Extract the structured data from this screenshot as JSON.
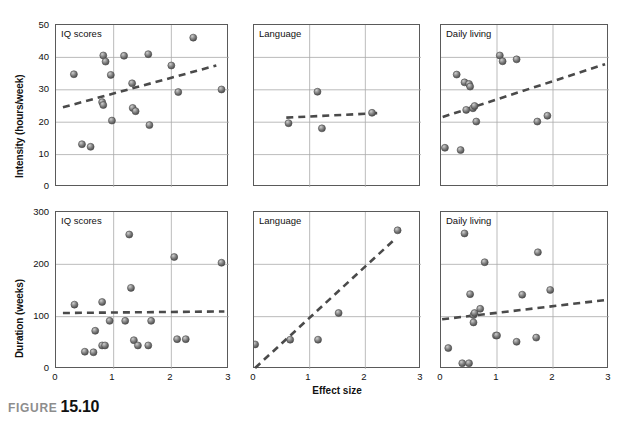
{
  "figure": {
    "caption_word": "FIGURE",
    "caption_number": "15.10"
  },
  "axes": {
    "xlabel": "Effect size",
    "ylabel_top": "Intensity (hours/week)",
    "ylabel_bottom": "Duration (weeks)",
    "xticks": [
      "0",
      "1",
      "2",
      "3"
    ],
    "yticks_top": [
      "0",
      "10",
      "20",
      "30",
      "40",
      "50"
    ],
    "yticks_bottom": [
      "0",
      "100",
      "200",
      "300"
    ]
  },
  "style": {
    "marker_fill": "#7d7d7d",
    "marker_edge": "#4a4a4a",
    "marker_highlight": "#cfcfcf",
    "trend_color": "#4a4a4a",
    "grid_color": "#aaaaaa",
    "frame_color": "#5a5a5a",
    "caption_word_color": "#8d8d8d"
  },
  "panel_titles": {
    "iq": "IQ scores",
    "language": "Language",
    "daily": "Daily living"
  },
  "chart_data": [
    {
      "id": "top-iq",
      "type": "scatter",
      "title": "IQ scores",
      "xlabel": "Effect size",
      "ylabel": "Intensity (hours/week)",
      "xlim": [
        0,
        3
      ],
      "ylim": [
        0,
        50
      ],
      "grid": true,
      "points": [
        {
          "x": 0.31,
          "y": 34.8
        },
        {
          "x": 0.45,
          "y": 13.2
        },
        {
          "x": 0.6,
          "y": 12.4
        },
        {
          "x": 0.82,
          "y": 40.6
        },
        {
          "x": 0.86,
          "y": 38.7
        },
        {
          "x": 0.8,
          "y": 26.2
        },
        {
          "x": 0.82,
          "y": 25.3
        },
        {
          "x": 0.95,
          "y": 34.6
        },
        {
          "x": 0.97,
          "y": 20.5
        },
        {
          "x": 1.18,
          "y": 40.5
        },
        {
          "x": 1.32,
          "y": 32.0
        },
        {
          "x": 1.33,
          "y": 24.4
        },
        {
          "x": 1.38,
          "y": 23.4
        },
        {
          "x": 1.6,
          "y": 41.0
        },
        {
          "x": 1.62,
          "y": 19.1
        },
        {
          "x": 2.0,
          "y": 37.5
        },
        {
          "x": 2.12,
          "y": 29.3
        },
        {
          "x": 2.38,
          "y": 46.1
        },
        {
          "x": 2.87,
          "y": 30.1
        }
      ],
      "trendline": {
        "x0": 0.12,
        "y0": 24.6,
        "x1": 2.78,
        "y1": 37.5
      }
    },
    {
      "id": "top-language",
      "type": "scatter",
      "title": "Language",
      "xlabel": "Effect size",
      "ylabel": "Intensity (hours/week)",
      "xlim": [
        0,
        3
      ],
      "ylim": [
        0,
        50
      ],
      "grid": true,
      "points": [
        {
          "x": 0.62,
          "y": 19.7
        },
        {
          "x": 1.14,
          "y": 29.4
        },
        {
          "x": 1.22,
          "y": 18.1
        },
        {
          "x": 2.12,
          "y": 22.9
        }
      ],
      "trendline": {
        "x0": 0.58,
        "y0": 21.4,
        "x1": 2.22,
        "y1": 22.8
      }
    },
    {
      "id": "top-daily",
      "type": "scatter",
      "title": "Daily living",
      "xlabel": "Effect size",
      "ylabel": "Intensity (hours/week)",
      "xlim": [
        0,
        3
      ],
      "ylim": [
        0,
        50
      ],
      "grid": true,
      "points": [
        {
          "x": 0.07,
          "y": 12.1
        },
        {
          "x": 0.28,
          "y": 34.7
        },
        {
          "x": 0.35,
          "y": 11.4
        },
        {
          "x": 0.42,
          "y": 32.3
        },
        {
          "x": 0.5,
          "y": 31.8
        },
        {
          "x": 0.52,
          "y": 31.0
        },
        {
          "x": 0.45,
          "y": 23.8
        },
        {
          "x": 0.57,
          "y": 24.3
        },
        {
          "x": 0.6,
          "y": 25.0
        },
        {
          "x": 0.63,
          "y": 20.2
        },
        {
          "x": 1.05,
          "y": 40.6
        },
        {
          "x": 1.1,
          "y": 38.8
        },
        {
          "x": 1.35,
          "y": 39.4
        },
        {
          "x": 1.72,
          "y": 20.2
        },
        {
          "x": 1.9,
          "y": 22.0
        }
      ],
      "trendline": {
        "x0": 0.03,
        "y0": 21.6,
        "x1": 2.93,
        "y1": 37.9
      }
    },
    {
      "id": "bottom-iq",
      "type": "scatter",
      "title": "IQ scores",
      "xlabel": "Effect size",
      "ylabel": "Duration (weeks)",
      "xlim": [
        0,
        3
      ],
      "ylim": [
        0,
        300
      ],
      "grid": true,
      "points": [
        {
          "x": 0.32,
          "y": 123
        },
        {
          "x": 0.5,
          "y": 33
        },
        {
          "x": 0.65,
          "y": 32
        },
        {
          "x": 0.68,
          "y": 73
        },
        {
          "x": 0.8,
          "y": 128
        },
        {
          "x": 0.8,
          "y": 45
        },
        {
          "x": 0.85,
          "y": 45
        },
        {
          "x": 0.93,
          "y": 92
        },
        {
          "x": 1.2,
          "y": 92
        },
        {
          "x": 1.27,
          "y": 257
        },
        {
          "x": 1.3,
          "y": 155
        },
        {
          "x": 1.35,
          "y": 55
        },
        {
          "x": 1.42,
          "y": 45
        },
        {
          "x": 1.6,
          "y": 45
        },
        {
          "x": 1.65,
          "y": 92
        },
        {
          "x": 2.05,
          "y": 214
        },
        {
          "x": 2.1,
          "y": 57
        },
        {
          "x": 2.25,
          "y": 57
        },
        {
          "x": 2.87,
          "y": 203
        }
      ],
      "trendline": {
        "x0": 0.12,
        "y0": 107,
        "x1": 2.92,
        "y1": 110
      }
    },
    {
      "id": "bottom-language",
      "type": "scatter",
      "title": "Language",
      "xlabel": "Effect size",
      "ylabel": "Duration (weeks)",
      "xlim": [
        0,
        3
      ],
      "ylim": [
        0,
        300
      ],
      "grid": true,
      "points": [
        {
          "x": 0.02,
          "y": 47
        },
        {
          "x": 0.65,
          "y": 56
        },
        {
          "x": 1.15,
          "y": 56
        },
        {
          "x": 1.52,
          "y": 107
        },
        {
          "x": 2.58,
          "y": 265
        }
      ],
      "trendline": {
        "x0": 0.02,
        "y0": 2,
        "x1": 2.52,
        "y1": 247
      }
    },
    {
      "id": "bottom-daily",
      "type": "scatter",
      "title": "Daily living",
      "xlabel": "Effect size",
      "ylabel": "Duration (weeks)",
      "xlim": [
        0,
        3
      ],
      "ylim": [
        0,
        300
      ],
      "grid": true,
      "points": [
        {
          "x": 0.13,
          "y": 40
        },
        {
          "x": 0.38,
          "y": 11
        },
        {
          "x": 0.42,
          "y": 259
        },
        {
          "x": 0.5,
          "y": 11
        },
        {
          "x": 0.52,
          "y": 143
        },
        {
          "x": 0.58,
          "y": 103
        },
        {
          "x": 0.6,
          "y": 107
        },
        {
          "x": 0.58,
          "y": 89
        },
        {
          "x": 0.7,
          "y": 115
        },
        {
          "x": 0.78,
          "y": 204
        },
        {
          "x": 0.98,
          "y": 64
        },
        {
          "x": 1.0,
          "y": 64
        },
        {
          "x": 1.35,
          "y": 52
        },
        {
          "x": 1.45,
          "y": 142
        },
        {
          "x": 1.7,
          "y": 60
        },
        {
          "x": 1.73,
          "y": 223
        },
        {
          "x": 1.95,
          "y": 151
        }
      ],
      "trendline": {
        "x0": 0.02,
        "y0": 95,
        "x1": 2.95,
        "y1": 132
      }
    }
  ]
}
